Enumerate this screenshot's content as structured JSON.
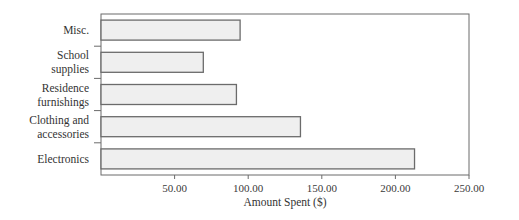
{
  "chart_data": {
    "type": "bar",
    "orientation": "horizontal",
    "title": "",
    "xlabel": "Amount Spent ($)",
    "ylabel": "",
    "categories": [
      "Misc.",
      "School supplies",
      "Residence furnishings",
      "Clothing and accessories",
      "Electronics"
    ],
    "category_label_lines": [
      [
        "Misc."
      ],
      [
        "School",
        "supplies"
      ],
      [
        "Residence",
        "furnishings"
      ],
      [
        "Clothing and",
        "accessories"
      ],
      [
        "Electronics"
      ]
    ],
    "values": [
      94.5,
      69.5,
      92.0,
      135.5,
      213.0
    ],
    "xlim": [
      0,
      250
    ],
    "xticks": [
      50,
      100,
      150,
      200,
      250
    ],
    "xtick_labels": [
      "50.00",
      "100.00",
      "150.00",
      "200.00",
      "250.00"
    ],
    "grid": false,
    "legend": null,
    "colors": {
      "bar_fill": "#efefef",
      "bar_edge": "#6b6b6b",
      "axis": "#6b6b6b"
    }
  }
}
